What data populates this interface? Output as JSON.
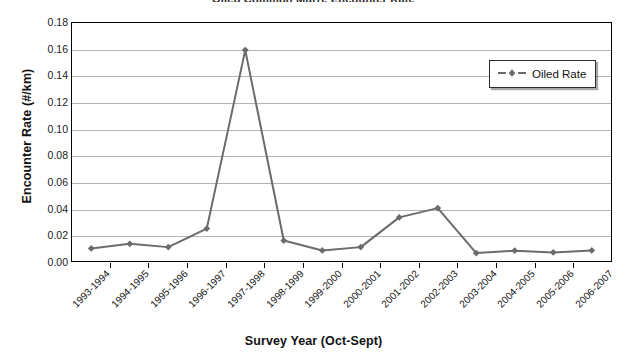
{
  "chart_data": {
    "type": "line",
    "title": "Oiled Common Murre Encounter Rate",
    "xlabel": "Survey Year (Oct-Sept)",
    "ylabel": "Encounter Rate (#/km)",
    "ylim": [
      0,
      0.18
    ],
    "ytick_values": [
      0.0,
      0.02,
      0.04,
      0.06,
      0.08,
      0.1,
      0.12,
      0.14,
      0.16,
      0.18
    ],
    "ytick_labels": [
      "0.00",
      "0.02",
      "0.04",
      "0.06",
      "0.08",
      "0.10",
      "0.12",
      "0.14",
      "0.16",
      "0.18"
    ],
    "grid": "horizontal",
    "legend_position": "upper right",
    "categories": [
      "1993-1994",
      "1994-1995",
      "1995-1996",
      "1996-1997",
      "1997-1998",
      "1998-1999",
      "1999-2000",
      "2000-2001",
      "2001-2002",
      "2002-2003",
      "2003-2004",
      "2004-2005",
      "2005-2006",
      "2006-2007"
    ],
    "series": [
      {
        "name": "Oiled Rate",
        "color": "#6b6b6b",
        "marker": "diamond",
        "linestyle": "solid",
        "values": [
          0.0095,
          0.013,
          0.0105,
          0.0245,
          0.1595,
          0.0155,
          0.008,
          0.0105,
          0.033,
          0.04,
          0.006,
          0.0078,
          0.0065,
          0.008
        ]
      }
    ]
  },
  "legend": {
    "entries": [
      {
        "label": "Oiled Rate",
        "icon": "dashed-line-diamond-marker"
      }
    ]
  }
}
